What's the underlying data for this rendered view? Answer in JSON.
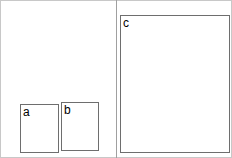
{
  "panels": {
    "left": {
      "boxes": [
        {
          "label": "a"
        },
        {
          "label": "b"
        }
      ]
    },
    "right": {
      "boxes": [
        {
          "label": "c"
        }
      ]
    }
  },
  "colors": {
    "box_border": "#6e6e6e",
    "divider": "#a0a0a0",
    "frame_border": "#c8c8c8"
  }
}
